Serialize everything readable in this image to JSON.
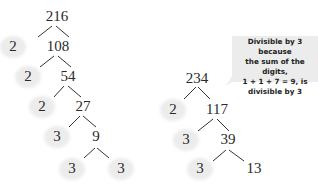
{
  "trees": [
    {
      "root": "216",
      "nodes": [
        {
          "id": "n216",
          "label": "216",
          "x": 57,
          "y": 8
        },
        {
          "id": "n2a",
          "label": "2",
          "x": 13,
          "y": 38,
          "prime": true
        },
        {
          "id": "n108",
          "label": "108",
          "x": 58,
          "y": 38
        },
        {
          "id": "n2b",
          "label": "2",
          "x": 28,
          "y": 68,
          "prime": true
        },
        {
          "id": "n54",
          "label": "54",
          "x": 68,
          "y": 68
        },
        {
          "id": "n2c",
          "label": "2",
          "x": 42,
          "y": 98,
          "prime": true
        },
        {
          "id": "n27",
          "label": "27",
          "x": 83,
          "y": 98
        },
        {
          "id": "n3a",
          "label": "3",
          "x": 57,
          "y": 128,
          "prime": true
        },
        {
          "id": "n9",
          "label": "9",
          "x": 96,
          "y": 128
        },
        {
          "id": "n3b",
          "label": "3",
          "x": 72,
          "y": 160,
          "prime": true
        },
        {
          "id": "n3c",
          "label": "3",
          "x": 121,
          "y": 160,
          "prime": true
        }
      ]
    },
    {
      "root": "234",
      "nodes": [
        {
          "id": "m234",
          "label": "234",
          "x": 197,
          "y": 70
        },
        {
          "id": "m2",
          "label": "2",
          "x": 173,
          "y": 101,
          "prime": true
        },
        {
          "id": "m117",
          "label": "117",
          "x": 217,
          "y": 101
        },
        {
          "id": "m3a",
          "label": "3",
          "x": 186,
          "y": 131,
          "prime": true
        },
        {
          "id": "m39",
          "label": "39",
          "x": 228,
          "y": 131
        },
        {
          "id": "m3b",
          "label": "3",
          "x": 200,
          "y": 160,
          "prime": true
        },
        {
          "id": "m13",
          "label": "13",
          "x": 254,
          "y": 160
        }
      ]
    }
  ],
  "callout": {
    "lines": [
      "Divisible by 3 because",
      "the sum of the digits,",
      "1 + 1 + 7 = 9, is",
      "divisible by 3"
    ]
  }
}
